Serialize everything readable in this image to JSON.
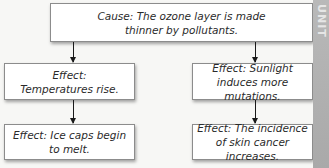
{
  "cause": {
    "text": "Cause: The ozone layer is made thinner by pollutants."
  },
  "left_chain": [
    {
      "text": "Effect: Temperatures rise."
    },
    {
      "text": "Effect: Ice caps begin to melt."
    }
  ],
  "right_chain": [
    {
      "text": "Effect: Sunlight induces more mutations."
    },
    {
      "text": "Effect: The incidence of skin cancer increases."
    }
  ],
  "side_tab": {
    "text": "UNIT"
  },
  "colors": {
    "box_border": "#8c8c8c",
    "arrow": "#1a1a1a",
    "side_strip": "#b0b0b0"
  }
}
